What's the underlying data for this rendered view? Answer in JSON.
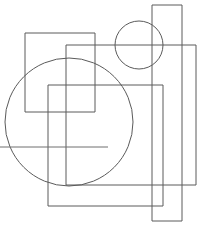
{
  "canvas": {
    "width": 207,
    "height": 231,
    "background_color": "#ffffff",
    "description": "Abstract line drawing of overlapping unfilled rectangles and circles"
  },
  "style": {
    "stroke_color": "#5a5a5a",
    "stroke_color_light": "#6e6e6e",
    "stroke_width": 1,
    "fill": "none"
  },
  "shapes": [
    {
      "id": "rect-tall-right",
      "type": "rect",
      "label": "Tall narrow rectangle on right",
      "x": 152,
      "y": 5,
      "width": 30,
      "height": 216,
      "stroke": "#5a5a5a"
    },
    {
      "id": "rect-top-left",
      "type": "rect",
      "label": "Square rectangle upper left",
      "x": 25,
      "y": 33,
      "width": 70,
      "height": 79,
      "stroke": "#5a5a5a"
    },
    {
      "id": "rect-large-mid",
      "type": "rect",
      "label": "Large rectangle middle right",
      "x": 66,
      "y": 45,
      "width": 130,
      "height": 140,
      "stroke": "#5a5a5a"
    },
    {
      "id": "rect-lower-inner",
      "type": "rect",
      "label": "Rectangle lower center",
      "x": 48,
      "y": 85,
      "width": 115,
      "height": 121,
      "stroke": "#5a5a5a"
    },
    {
      "id": "circle-large",
      "type": "circle",
      "label": "Large circle left of center",
      "cx": 69,
      "cy": 122,
      "r": 64,
      "stroke": "#5a5a5a"
    },
    {
      "id": "circle-small",
      "type": "circle",
      "label": "Small circle top right",
      "cx": 139,
      "cy": 45,
      "r": 24,
      "stroke": "#5a5a5a"
    },
    {
      "id": "line-horizontal-left",
      "type": "line",
      "label": "Horizontal line extending to left edge",
      "x1": 0,
      "y1": 147,
      "x2": 108,
      "y2": 147,
      "stroke": "#6e6e6e"
    }
  ]
}
